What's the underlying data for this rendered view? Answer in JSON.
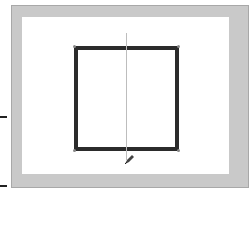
{
  "canvas": {
    "frame_color": "#c9c9c9",
    "background_color": "#ffffff",
    "shape": {
      "type": "rectangle",
      "stroke_color": "#2b2b2b",
      "stroke_width": 4
    },
    "guide_line": {
      "orientation": "vertical",
      "color": "#bdbdbd"
    },
    "cursor": "pen-cursor-icon"
  }
}
